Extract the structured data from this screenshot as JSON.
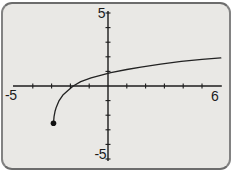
{
  "figure": {
    "kind": "graphing-calculator-screen",
    "background_color": "#e9e8e5",
    "border_color": "#828282",
    "axis_color": "#1c1c1c",
    "curve_color": "#222222"
  },
  "chart_data": {
    "type": "line",
    "title": "",
    "xlabel": "",
    "ylabel": "",
    "xlim": [
      -5,
      6
    ],
    "ylim": [
      -5,
      5
    ],
    "x_tick_step": 1,
    "y_tick_step": 1,
    "grid": false,
    "legend": false,
    "axis_tick_labels": {
      "y_max": "5",
      "y_min": "-5",
      "x_min": "-5",
      "x_max": "6"
    },
    "series": [
      {
        "name": "logarithmic-curve",
        "color": "#222222",
        "endpoint_marker": {
          "x": -2.9,
          "y": -2.55,
          "type": "filled-dot"
        },
        "points": [
          [
            -2.9,
            -2.55
          ],
          [
            -2.87,
            -2.1
          ],
          [
            -2.82,
            -1.75
          ],
          [
            -2.75,
            -1.45
          ],
          [
            -2.6,
            -1.0
          ],
          [
            -2.4,
            -0.62
          ],
          [
            -2.1,
            -0.27
          ],
          [
            -1.85,
            0.0
          ],
          [
            -1.45,
            0.3
          ],
          [
            -0.9,
            0.55
          ],
          [
            -0.35,
            0.75
          ],
          [
            0.15,
            0.92
          ],
          [
            1.0,
            1.13
          ],
          [
            1.75,
            1.3
          ],
          [
            2.8,
            1.5
          ],
          [
            3.9,
            1.68
          ],
          [
            5.0,
            1.82
          ],
          [
            6.0,
            1.92
          ]
        ]
      }
    ]
  }
}
